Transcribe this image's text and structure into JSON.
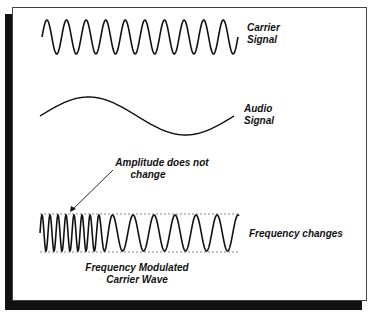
{
  "diagram": {
    "carrier": {
      "label_line1": "Carrier",
      "label_line2": "Signal",
      "cycles": 10
    },
    "audio": {
      "label_line1": "Audio",
      "label_line2": "Signal"
    },
    "annotation": {
      "line1": "Amplitude does not",
      "line2": "change"
    },
    "fm_wave": {
      "side_label": "Frequency changes",
      "caption_line1": "Frequency Modulated",
      "caption_line2": "Carrier Wave"
    },
    "colors": {
      "stroke": "#111111",
      "background": "#ffffff",
      "shadow": "#111111",
      "guide": "#666666"
    }
  }
}
